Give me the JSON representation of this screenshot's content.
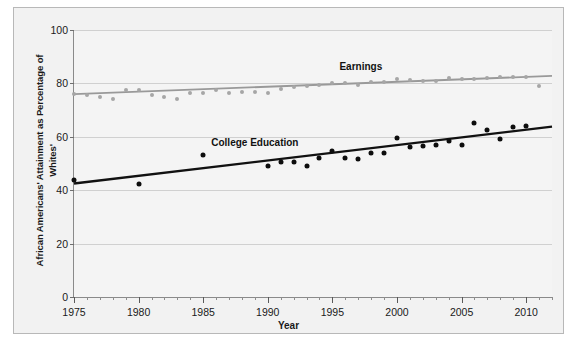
{
  "chart_data": {
    "type": "scatter",
    "title": "",
    "xlabel": "Year",
    "ylabel": "African Americans' Attainment as Percentage of Whites'",
    "xlim": [
      1975,
      2012
    ],
    "ylim": [
      0,
      100
    ],
    "grid": true,
    "legend_position": "inline-annotation",
    "xticks": [
      1975,
      1980,
      1985,
      1990,
      1995,
      2000,
      2005,
      2010
    ],
    "xtick_labels": [
      "1975",
      "1980",
      "1985",
      "1990",
      "1995",
      "2000",
      "2005",
      "2010"
    ],
    "xtick_minor_step": 1,
    "yticks": [
      0,
      20,
      40,
      60,
      80,
      100
    ],
    "ytick_labels": [
      "0",
      "20",
      "40",
      "60",
      "80",
      "100"
    ],
    "series": [
      {
        "name": "Earnings",
        "color": "#a6a6a6",
        "trend_color": "#999999",
        "label_x": 1997.2,
        "label_y": 86.5,
        "trend": [
          [
            1975,
            76.0
          ],
          [
            2012,
            82.8
          ]
        ],
        "x": [
          1975,
          1976,
          1977,
          1978,
          1979,
          1980,
          1981,
          1982,
          1983,
          1984,
          1985,
          1986,
          1987,
          1988,
          1989,
          1990,
          1991,
          1992,
          1993,
          1994,
          1995,
          1996,
          1997,
          1998,
          1999,
          2000,
          2001,
          2002,
          2003,
          2004,
          2005,
          2006,
          2007,
          2008,
          2009,
          2010,
          2011
        ],
        "values": [
          76.2,
          75.5,
          75.0,
          74.2,
          77.7,
          77.5,
          75.5,
          75.0,
          74.0,
          76.5,
          76.5,
          77.5,
          76.5,
          76.8,
          76.8,
          76.5,
          78.0,
          78.5,
          79.0,
          79.5,
          80.0,
          80.0,
          79.5,
          80.5,
          80.5,
          81.5,
          81.2,
          81.0,
          81.0,
          82.0,
          81.5,
          81.5,
          82.0,
          82.5,
          82.5,
          82.5,
          79.2
        ]
      },
      {
        "name": "College Education",
        "color": "#0d0d0d",
        "trend_color": "#111111",
        "label_x": 1989.0,
        "label_y": 58.0,
        "trend": [
          [
            1975,
            42.5
          ],
          [
            2012,
            63.8
          ]
        ],
        "x": [
          1975,
          1980,
          1985,
          1990,
          1991,
          1992,
          1993,
          1994,
          1995,
          1996,
          1997,
          1998,
          1999,
          2000,
          2001,
          2002,
          2003,
          2004,
          2005,
          2006,
          2007,
          2008,
          2009,
          2010
        ],
        "values": [
          44.0,
          42.5,
          53.0,
          49.0,
          50.5,
          50.5,
          49.0,
          52.0,
          54.5,
          52.0,
          51.5,
          54.0,
          54.0,
          59.5,
          56.0,
          56.5,
          57.0,
          58.5,
          57.0,
          65.0,
          62.5,
          59.0,
          63.5,
          64.0
        ]
      }
    ]
  }
}
